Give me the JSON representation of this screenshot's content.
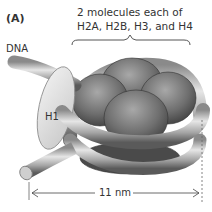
{
  "figure": {
    "panel_label": "(A)",
    "histone_label_line1": "2 molecules each of",
    "histone_label_line2": "H2A, H2B, H3, and H4",
    "dna_label": "DNA",
    "linker_histone_label": "H1",
    "dimension_label": "11 nm"
  },
  "colors": {
    "dna_tube": "#b5b5b5",
    "histone_core": "#7a7a7a",
    "h1_protein": "#e0e0e0",
    "text": "#333333"
  }
}
